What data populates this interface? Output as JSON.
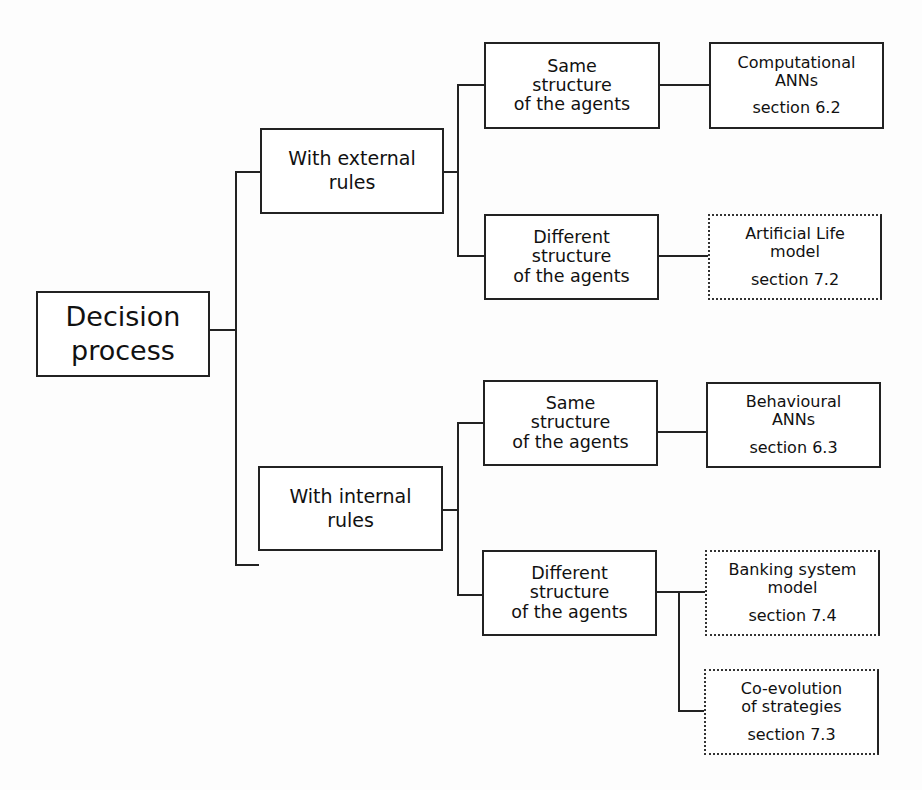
{
  "diagram": {
    "root": {
      "lines": [
        "Decision",
        "process"
      ]
    },
    "level1": [
      {
        "id": "external",
        "lines": [
          "With external",
          "rules"
        ]
      },
      {
        "id": "internal",
        "lines": [
          "With internal",
          "rules"
        ]
      }
    ],
    "level2": [
      {
        "id": "ext-same",
        "lines": [
          "Same",
          "structure",
          "of the agents"
        ]
      },
      {
        "id": "ext-diff",
        "lines": [
          "Different",
          "structure",
          "of the agents"
        ]
      },
      {
        "id": "int-same",
        "lines": [
          "Same",
          "structure",
          "of the agents"
        ]
      },
      {
        "id": "int-diff",
        "lines": [
          "Different",
          "structure",
          "of the agents"
        ]
      }
    ],
    "leaves": [
      {
        "id": "computational",
        "lines": [
          "Computational",
          "ANNs"
        ],
        "section": "section 6.2",
        "border": "solid"
      },
      {
        "id": "artificial-life",
        "lines": [
          "Artificial Life",
          "model"
        ],
        "section": "section 7.2",
        "border": "dotted"
      },
      {
        "id": "behavioural",
        "lines": [
          "Behavioural",
          "ANNs"
        ],
        "section": "section 6.3",
        "border": "solid"
      },
      {
        "id": "banking",
        "lines": [
          "Banking system",
          "model"
        ],
        "section": "section 7.4",
        "border": "dotted"
      },
      {
        "id": "co-evolution",
        "lines": [
          "Co-evolution",
          "of strategies"
        ],
        "section": "section 7.3",
        "border": "dotted"
      }
    ]
  }
}
